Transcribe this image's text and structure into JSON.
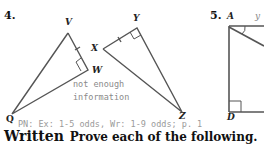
{
  "problems": [
    {
      "number": "4.",
      "figure_1": {
        "vertices": [
          "V",
          "W",
          "Q"
        ],
        "right_angle_at": "W"
      },
      "figure_2": {
        "vertices": [
          "X",
          "Y",
          "Z"
        ],
        "right_angle_at": "Y"
      },
      "answer_note_line1": "not enough",
      "answer_note_line2": "information"
    },
    {
      "number": "5.",
      "figure": {
        "vertices": [
          "A",
          "D"
        ],
        "right_angle_at": "D",
        "partial_label": "y"
      }
    }
  ],
  "homework_note": "PN:  Ex:  1-5 odds, Wr:  1-9 odds; p. 1",
  "section": {
    "title": "Written",
    "instruction": "Prove each of the following."
  },
  "colors": {
    "line": "#555555",
    "text": "#111111",
    "note": "#8a8a8a"
  }
}
